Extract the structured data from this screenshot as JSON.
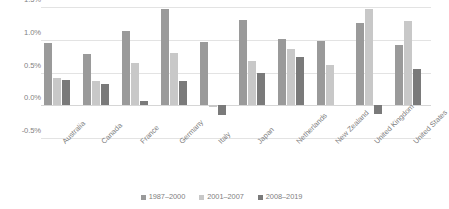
{
  "chart_data": {
    "type": "bar",
    "title": "",
    "subtitle": "",
    "xlabel": "",
    "ylabel": "",
    "ylim": [
      -0.5,
      1.5
    ],
    "ytick_values": [
      1.5,
      1.0,
      0.5,
      0.0,
      -0.5
    ],
    "ytick_labels": [
      "1.5%",
      "1.0%",
      "0.5%",
      "0.0%",
      "-0.5%"
    ],
    "grid": true,
    "legend_position": "bottom",
    "categories": [
      "Australia",
      "Canada",
      "France",
      "Germany",
      "Italy",
      "Japan",
      "Netherlands",
      "New Zealand",
      "United Kingdom",
      "United States"
    ],
    "series": [
      {
        "name": "1987–2000",
        "color": "#9a9a9a",
        "values": [
          0.95,
          0.78,
          1.14,
          1.47,
          0.96,
          1.3,
          1.01,
          0.98,
          1.26,
          0.92
        ]
      },
      {
        "name": "2001–2007",
        "color": "#c8c8c8",
        "values": [
          0.42,
          0.37,
          0.64,
          0.8,
          -0.03,
          0.68,
          0.86,
          0.61,
          1.47,
          1.28
        ]
      },
      {
        "name": "2008–2019",
        "color": "#7a7a7a",
        "values": [
          0.38,
          0.32,
          0.07,
          0.37,
          -0.15,
          0.5,
          0.73,
          0.0,
          -0.13,
          0.56
        ]
      }
    ]
  }
}
